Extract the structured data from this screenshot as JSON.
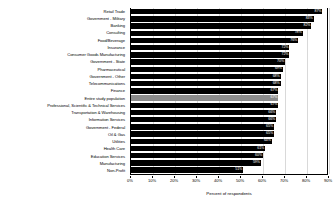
{
  "chart_data": {
    "type": "bar",
    "orientation": "horizontal",
    "title": "",
    "xlabel": "Percent of respondents",
    "ylabel": "",
    "xlim": [
      0,
      90
    ],
    "xticks": [
      0,
      10,
      20,
      30,
      40,
      50,
      60,
      70,
      80,
      90
    ],
    "xtick_labels": [
      "0%",
      "10%",
      "20%",
      "30%",
      "40%",
      "50%",
      "60%",
      "70%",
      "80%",
      "90%"
    ],
    "grid": true,
    "legend": "none",
    "highlight_category": "Entire study population",
    "colors": {
      "bar": "#000000",
      "highlight_bar": "#8c8c8c",
      "value_label": "#ffffff",
      "gridline": "#d9d9d9",
      "axis": "#000000",
      "background": "#ffffff"
    },
    "categories": [
      "Retail Trade",
      "Government - Military",
      "Banking",
      "Consulting",
      "Food/Beverage",
      "Insurance",
      "Consumer Goods Manufacturing",
      "Government - State",
      "Pharmaceutical",
      "Government - Other",
      "Telecommunications",
      "Finance",
      "Entire study population",
      "Professional, Scientific & Technical Services",
      "Transportation & Warehousing",
      "Information Services",
      "Government - Federal",
      "Oil & Gas",
      "Utilities",
      "Health Care",
      "Education Services",
      "Manufacturing",
      "Non-Profit"
    ],
    "values": [
      87,
      83,
      82,
      78,
      76,
      72,
      72,
      70,
      69,
      68,
      68,
      67,
      67,
      67,
      66,
      66,
      65,
      65,
      64,
      61,
      60,
      59,
      51
    ],
    "value_labels": [
      "87%",
      "83%",
      "82%",
      "78%",
      "76%",
      "72%",
      "72%",
      "70%",
      "69%",
      "68%",
      "68%",
      "67%",
      "67%",
      "67%",
      "66%",
      "66%",
      "65%",
      "65%",
      "64%",
      "61%",
      "60%",
      "59%",
      "51%"
    ]
  }
}
